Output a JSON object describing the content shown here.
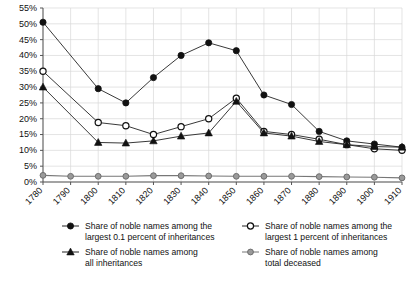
{
  "chart_data": {
    "type": "line",
    "title": "",
    "xlabel": "",
    "ylabel": "",
    "x": [
      1780,
      1790,
      1800,
      1810,
      1820,
      1830,
      1840,
      1850,
      1860,
      1870,
      1880,
      1890,
      1900,
      1910
    ],
    "xtick_labels": [
      "1780",
      "1790",
      "1800",
      "1810",
      "1820",
      "1830",
      "1840",
      "1850",
      "1860",
      "1870",
      "1880",
      "1890",
      "1900",
      "1910"
    ],
    "ytick_labels": [
      "0%",
      "5%",
      "10%",
      "15%",
      "20%",
      "25%",
      "30%",
      "35%",
      "40%",
      "45%",
      "50%",
      "55%"
    ],
    "ytick_values": [
      0,
      5,
      10,
      15,
      20,
      25,
      30,
      35,
      40,
      45,
      50,
      55
    ],
    "ylim": [
      0,
      55
    ],
    "xlim": [
      1780,
      1910
    ],
    "grid": true,
    "legend_position": "bottom",
    "series": [
      {
        "name": "Share of noble names among the largest 0.1 percent of inheritances",
        "marker": "filled-circle",
        "color": "#111111",
        "x": [
          1780,
          1800,
          1810,
          1820,
          1830,
          1840,
          1850,
          1860,
          1870,
          1880,
          1890,
          1900,
          1910
        ],
        "values": [
          50.5,
          29.5,
          25.0,
          33.0,
          40.0,
          44.0,
          41.5,
          27.5,
          24.5,
          16.0,
          13.0,
          12.0,
          11.0
        ]
      },
      {
        "name": "Share of noble names among the largest 1 percent of inheritances",
        "marker": "hollow-circle",
        "color": "#111111",
        "x": [
          1780,
          1800,
          1810,
          1820,
          1830,
          1840,
          1850,
          1860,
          1870,
          1880,
          1890,
          1900,
          1910
        ],
        "values": [
          35.0,
          18.8,
          17.8,
          15.0,
          17.5,
          20.0,
          26.5,
          16.0,
          15.0,
          13.5,
          11.8,
          10.5,
          10.0
        ]
      },
      {
        "name": "Share of noble names among all inheritances",
        "marker": "filled-triangle",
        "color": "#111111",
        "x": [
          1780,
          1800,
          1810,
          1820,
          1830,
          1840,
          1850,
          1860,
          1870,
          1880,
          1890,
          1900,
          1910
        ],
        "values": [
          30.0,
          12.5,
          12.3,
          13.0,
          14.5,
          15.5,
          25.5,
          15.5,
          14.5,
          12.8,
          11.8,
          11.2,
          11.0
        ]
      },
      {
        "name": "Share of noble names among total deceased",
        "marker": "gray-circle",
        "color": "#8a8a8a",
        "x": [
          1780,
          1790,
          1800,
          1810,
          1820,
          1830,
          1840,
          1850,
          1860,
          1870,
          1880,
          1890,
          1900,
          1910
        ],
        "values": [
          2.1,
          1.8,
          1.8,
          1.8,
          2.0,
          2.0,
          1.9,
          1.8,
          1.8,
          1.8,
          1.7,
          1.6,
          1.5,
          1.3
        ]
      }
    ]
  },
  "legend": {
    "items": [
      {
        "line1": "Share of noble names among the",
        "line2": "largest 0.1 percent of inheritances",
        "marker": "filled-circle"
      },
      {
        "line1": "Share of noble names among the",
        "line2": "largest 1 percent of inheritances",
        "marker": "hollow-circle"
      },
      {
        "line1": "Share of noble names among",
        "line2": "all inheritances",
        "marker": "filled-triangle"
      },
      {
        "line1": "Share of noble names among",
        "line2": "total deceased",
        "marker": "gray-circle"
      }
    ]
  },
  "colors": {
    "primary": "#111111",
    "secondary": "#8a8a8a",
    "grid": "#d8d8d8",
    "axis": "#555555",
    "background": "#ffffff"
  }
}
